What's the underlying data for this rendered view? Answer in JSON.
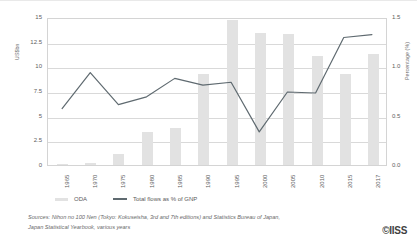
{
  "figure": {
    "left_axis_title": "US$bn",
    "right_axis_title": "Percentage (%)",
    "logo": "©IISS"
  },
  "legend": {
    "items": [
      {
        "label": "ODA",
        "marker": "bar-swatch",
        "color": "#e2e2e2"
      },
      {
        "label": "Total flows as % of GNP",
        "marker": "line-swatch",
        "color": "#5f6a70"
      }
    ]
  },
  "sources": {
    "line1": "Sources: Nihon no 100 Nen (Tokyo: Kokuseisha, 3rd and 7th editions) and Statistics Bureau of Japan,",
    "line2": "Japan Statistical Yearbook, various years"
  },
  "chart_data": {
    "type": "bar",
    "title": "",
    "xlabel": "",
    "categories": [
      "1965",
      "1970",
      "1975",
      "1980",
      "1985",
      "1990",
      "1995",
      "2000",
      "2005",
      "2010",
      "2015",
      "2017"
    ],
    "grid": true,
    "legend_position": "bottom-left",
    "series": [
      {
        "name": "ODA",
        "type": "bar",
        "axis": "left",
        "unit": "US$bn",
        "color": "#e2e2e2",
        "values": [
          0.1,
          0.25,
          1.1,
          3.35,
          3.8,
          9.2,
          14.7,
          13.4,
          13.25,
          11.0,
          9.2,
          11.3
        ]
      },
      {
        "name": "Total flows as % of GNP",
        "type": "line",
        "axis": "right",
        "unit": "%",
        "color": "#5f6a70",
        "values": [
          0.58,
          0.95,
          0.62,
          0.7,
          0.89,
          0.82,
          0.85,
          0.34,
          0.75,
          0.74,
          1.31,
          1.34
        ]
      }
    ],
    "left_axis": {
      "label": "US$bn",
      "ylim": [
        0,
        15
      ],
      "ticks": [
        0,
        2.5,
        5,
        7.5,
        10,
        12.5,
        15
      ],
      "tick_labels": [
        "0",
        "2.5",
        "5",
        "7.5",
        "10",
        "12.5",
        "15"
      ]
    },
    "right_axis": {
      "label": "Percentage (%)",
      "ylim": [
        0,
        1.5
      ],
      "ticks": [
        0.0,
        0.5,
        1.0,
        1.5
      ],
      "tick_labels": [
        "0.0",
        "0.5",
        "1.0",
        "1.5"
      ]
    }
  }
}
